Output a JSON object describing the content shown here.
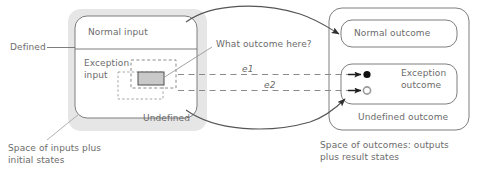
{
  "diagram": {
    "colors": {
      "stroke": "#6f6f6f",
      "text": "#6b6b6b",
      "shadow": "#e2e2e2",
      "fill_box": "#d6d6d6",
      "white": "#ffffff",
      "dashed": "#8a8a8a",
      "arrow": "#3a3a3a",
      "circle_solid": "#111111",
      "circle_hollow": "#9a9a9a"
    },
    "left": {
      "shadow_label": "Undefined",
      "normal_input": "Normal input",
      "exception_input_line1": "Exception",
      "exception_input_line2": "input",
      "defined_label": "Defined",
      "caption_line1": "Space of inputs plus",
      "caption_line2": "initial states"
    },
    "middle": {
      "question": "What outcome here?",
      "edge_labels": [
        "e1",
        "e2"
      ]
    },
    "right": {
      "normal_outcome": "Normal outcome",
      "exception_outcome_line1": "Exception",
      "exception_outcome_line2": "outcome",
      "undefined_outcome": "Undefined outcome",
      "caption_line1": "Space of outcomes: outputs",
      "caption_line2": "plus result states"
    }
  }
}
